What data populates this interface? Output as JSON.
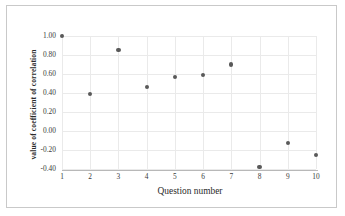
{
  "chart_data": {
    "type": "scatter",
    "title": "",
    "xlabel": "Question number",
    "ylabel": "value of coefficient of correlation",
    "x": [
      1,
      2,
      3,
      4,
      5,
      6,
      7,
      8,
      9,
      10
    ],
    "categories": [
      "1",
      "2",
      "3",
      "4",
      "5",
      "6",
      "7",
      "8",
      "9",
      "10"
    ],
    "values": [
      1.0,
      0.39,
      0.85,
      0.46,
      0.57,
      0.59,
      0.7,
      -0.38,
      -0.13,
      -0.25
    ],
    "series": [
      {
        "name": "coefficient of correlation",
        "values": [
          1.0,
          0.39,
          0.85,
          0.46,
          0.57,
          0.59,
          0.7,
          -0.38,
          -0.13,
          -0.25
        ]
      }
    ],
    "xlim": [
      1,
      10
    ],
    "ylim": [
      -0.4,
      1.0
    ],
    "ytick_labels": [
      "1.00",
      "0.80",
      "0.60",
      "0.40",
      "0.20",
      "0.00",
      "-0.20",
      "-0.40"
    ],
    "ytick_values": [
      1.0,
      0.8,
      0.6,
      0.4,
      0.2,
      0.0,
      -0.2,
      -0.4
    ],
    "xtick_labels": [
      "1",
      "2",
      "3",
      "4",
      "5",
      "6",
      "7",
      "8",
      "9",
      "10"
    ],
    "xtick_values": [
      1,
      2,
      3,
      4,
      5,
      6,
      7,
      8,
      9,
      10
    ],
    "grid": true,
    "grid_color": "#eaeaea",
    "legend": false,
    "legend_position": "none",
    "marker_color": "#595959",
    "marker_shape": "circle",
    "axis_color": "#b8b8b8",
    "frame_color": "#c9c9c9",
    "background": "#ffffff"
  }
}
